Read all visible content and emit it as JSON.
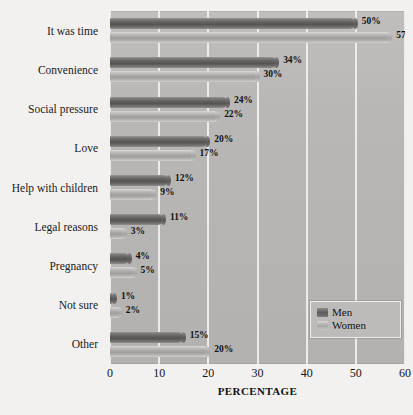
{
  "chart_data": {
    "type": "bar",
    "orientation": "horizontal",
    "title": "",
    "xlabel": "PERCENTAGE",
    "ylabel": "",
    "xlim": [
      0,
      60
    ],
    "xticks": [
      0,
      10,
      20,
      30,
      40,
      50,
      60
    ],
    "xtick_labels": [
      "0",
      "10",
      "20",
      "30",
      "40",
      "50",
      "60"
    ],
    "grid": true,
    "grid_axis": "x",
    "legend_position": "lower-right",
    "categories": [
      "It was time",
      "Convenience",
      "Social pressure",
      "Love",
      "Help with children",
      "Legal reasons",
      "Pregnancy",
      "Not sure",
      "Other"
    ],
    "series": [
      {
        "name": "Men",
        "color": "#66645f",
        "values": [
          50,
          34,
          24,
          20,
          12,
          11,
          4,
          1,
          15
        ],
        "value_labels": [
          "50%",
          "34%",
          "24%",
          "20%",
          "12%",
          "11%",
          "4%",
          "1%",
          "15%"
        ]
      },
      {
        "name": "Women",
        "color": "#aeaca9",
        "values": [
          57,
          30,
          22,
          17,
          9,
          3,
          5,
          2,
          20
        ],
        "value_labels": [
          "57%",
          "30%",
          "22%",
          "17%",
          "9%",
          "3%",
          "5%",
          "2%",
          "20%"
        ]
      }
    ]
  },
  "legend": {
    "items": [
      {
        "label": "Men"
      },
      {
        "label": "Women"
      }
    ]
  },
  "colors": {
    "page_background": "#f3f1ef",
    "plot_background": "#b9b7b5",
    "gridline": "#f0eeec",
    "men_bar": "#66645f",
    "women_bar": "#aeaca9",
    "text": "#141414"
  }
}
